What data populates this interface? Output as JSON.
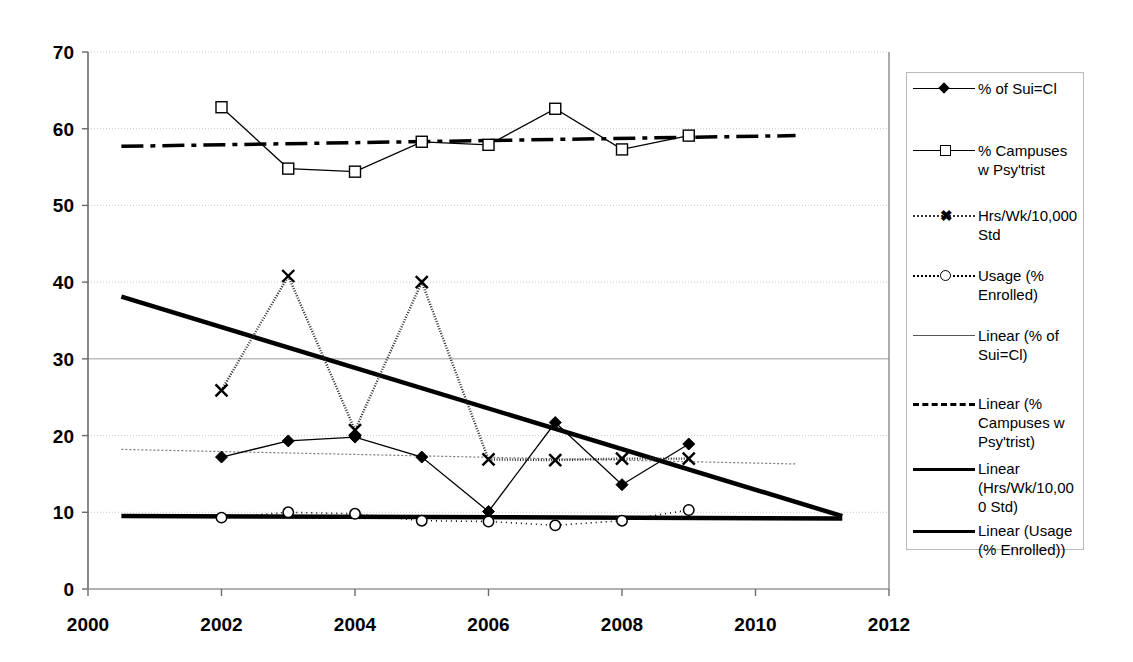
{
  "chart_data": {
    "type": "line",
    "title": "",
    "xlabel": "",
    "ylabel": "",
    "xlim": [
      2000,
      2012
    ],
    "ylim": [
      0,
      70
    ],
    "xticks": [
      "2000",
      "2002",
      "2004",
      "2006",
      "2008",
      "2010",
      "2012"
    ],
    "yticks": [
      "0",
      "10",
      "20",
      "30",
      "40",
      "50",
      "60",
      "70"
    ],
    "grid": true,
    "legend_position": "right",
    "x": [
      2002,
      2003,
      2004,
      2005,
      2006,
      2007,
      2008,
      2009
    ],
    "series": [
      {
        "name": "% of Sui=Cl",
        "marker": "diamond",
        "values": [
          17.2,
          19.3,
          19.8,
          17.2,
          10.1,
          21.7,
          13.6,
          18.9
        ]
      },
      {
        "name": "% Campuses w Psy'trist",
        "marker": "square",
        "values": [
          62.8,
          54.8,
          54.4,
          58.3,
          57.9,
          62.6,
          57.3,
          59.1
        ]
      },
      {
        "name": "Hrs/Wk/10,000 Std",
        "marker": "x",
        "values": [
          25.9,
          40.8,
          20.7,
          40.0,
          16.9,
          16.8,
          17.0,
          17.0
        ]
      },
      {
        "name": "Usage (% Enrolled)",
        "marker": "circle",
        "values": [
          9.3,
          10.0,
          9.8,
          8.9,
          8.8,
          8.3,
          8.9,
          10.3
        ]
      }
    ],
    "trendlines": [
      {
        "name": "Linear (% of Sui=Cl)",
        "style": "thin-gray",
        "x": [
          2000.5,
          2010.6
        ],
        "y": [
          18.2,
          16.3
        ]
      },
      {
        "name": "Linear (% Campuses w Psy'trist)",
        "style": "dashed-thick",
        "x": [
          2000.5,
          2010.6
        ],
        "y": [
          57.7,
          59.1
        ]
      },
      {
        "name": "Linear (Hrs/Wk/10,000 Std)",
        "style": "thick",
        "x": [
          2000.5,
          2011.3
        ],
        "y": [
          38.1,
          9.5
        ]
      },
      {
        "name": "Linear (Usage (% Enrolled))",
        "style": "thick",
        "x": [
          2000.5,
          2011.3
        ],
        "y": [
          9.5,
          9.2
        ]
      }
    ]
  },
  "legend": {
    "items": [
      {
        "label": "% of Sui=Cl",
        "marker": "diamond",
        "line": "solid"
      },
      {
        "label": "% Campuses\nw Psy'trist",
        "marker": "square",
        "line": "solid"
      },
      {
        "label": "Hrs/Wk/10,000\nStd",
        "marker": "x",
        "line": "xline"
      },
      {
        "label": "Usage (%\nEnrolled)",
        "marker": "circle",
        "line": "dotted"
      },
      {
        "label": "Linear (% of\nSui=Cl)",
        "marker": "none",
        "line": "thin-gray"
      },
      {
        "label": "Linear (%\nCampuses w\nPsy'trist)",
        "marker": "none",
        "line": "dashed"
      },
      {
        "label": "Linear\n(Hrs/Wk/10,00\n0 Std)",
        "marker": "none",
        "line": "thick"
      },
      {
        "label": "Linear (Usage\n(% Enrolled))",
        "marker": "none",
        "line": "thick"
      }
    ]
  },
  "colors": {
    "series": "#000000",
    "grid": "#c8c8c8",
    "axis": "#7f7f7f",
    "background": "#ffffff"
  }
}
